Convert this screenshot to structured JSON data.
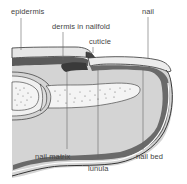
{
  "diagram": {
    "labels": {
      "epidermis": "epidermis",
      "dermis_in_nailfold": "dermis in nailfold",
      "cuticle": "cuticle",
      "nail": "nail",
      "nail_matrix": "nail matrix",
      "lunula": "lunula",
      "nail_bed": "nail bed"
    },
    "colors": {
      "background": "#ffffff",
      "tissue_fill": "#d4d4d4",
      "dermis_dark": "#5a5a5a",
      "nail_plate": "#e8e8e8",
      "bone": "#f2f2f2",
      "outline": "#333333",
      "leader_line": "#555555",
      "label_text": "#444444"
    }
  }
}
